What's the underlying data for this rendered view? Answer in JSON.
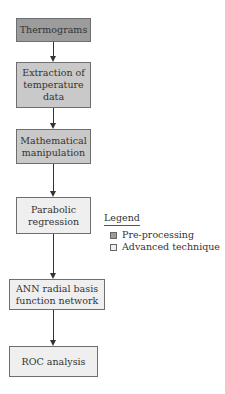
{
  "flowchart": {
    "nodes": [
      {
        "id": "thermograms",
        "label": "Thermograms",
        "category": "pre-processing"
      },
      {
        "id": "extraction",
        "label": "Extraction of temperature data",
        "category": "pre-processing"
      },
      {
        "id": "math",
        "label": "Mathematical manipulation",
        "category": "pre-processing"
      },
      {
        "id": "parabolic",
        "label": "Parabolic regression",
        "category": "advanced technique"
      },
      {
        "id": "ann",
        "label": "ANN radial basis function network",
        "category": "advanced technique"
      },
      {
        "id": "roc",
        "label": "ROC analysis",
        "category": "advanced technique"
      }
    ],
    "edges": [
      [
        "thermograms",
        "extraction"
      ],
      [
        "extraction",
        "math"
      ],
      [
        "math",
        "parabolic"
      ],
      [
        "parabolic",
        "ann"
      ],
      [
        "ann",
        "roc"
      ]
    ]
  },
  "labels": {
    "thermograms": "Thermograms",
    "extraction_l1": "Extraction of",
    "extraction_l2": "temperature",
    "extraction_l3": "data",
    "math_l1": "Mathematical",
    "math_l2": "manipulation",
    "parabolic_l1": "Parabolic",
    "parabolic_l2": "regression",
    "ann_l1": "ANN radial basis",
    "ann_l2": "function network",
    "roc": "ROC analysis"
  },
  "legend": {
    "title": "Legend",
    "items": [
      {
        "label": "Pre-processing",
        "color": "#9c9c9c"
      },
      {
        "label": "Advanced technique",
        "color": "#efefef"
      }
    ]
  },
  "colors": {
    "dark": "#9c9c9c",
    "mid": "#c9c9c9",
    "light": "#efefef"
  }
}
